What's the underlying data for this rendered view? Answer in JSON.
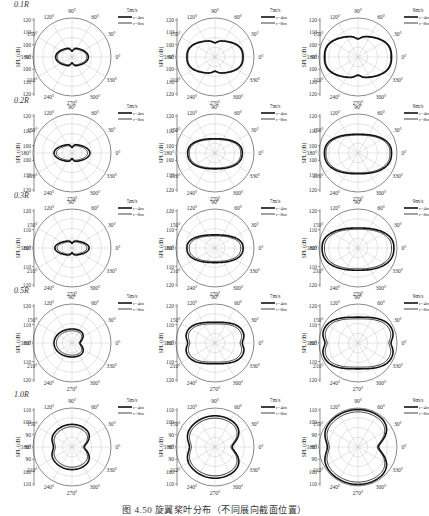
{
  "figure": {
    "caption": "图 4.50  旋翼桨叶分布（不同展向截面位置）"
  },
  "chart_data": {
    "type": "polar-grid",
    "angle_labels": [
      "0°",
      "30°",
      "60°",
      "90°",
      "120°",
      "150°",
      "180°",
      "210°",
      "240°",
      "270°",
      "300°",
      "330°"
    ],
    "ylabel": "SPL (dB)",
    "legend_entries": [
      "r=4m",
      "r=8m"
    ],
    "columns": [
      "5m/s",
      "7m/s",
      "9m/s"
    ],
    "rows": [
      {
        "label": "0.1R",
        "radial_ticks": [
          "120",
          "110",
          "100",
          "90",
          "100",
          "110",
          "120"
        ],
        "panels": [
          {
            "speed": "5m/s",
            "shape": "peanut",
            "size_r4": 0.42,
            "size_r8": 0.38,
            "aspect": 0.55
          },
          {
            "speed": "7m/s",
            "shape": "oval-flat",
            "size_r4": 0.72,
            "size_r8": 0.7,
            "aspect": 0.58
          },
          {
            "speed": "9m/s",
            "shape": "oval-flat",
            "size_r4": 0.86,
            "size_r8": 0.84,
            "aspect": 0.62
          }
        ]
      },
      {
        "label": "0.2R",
        "radial_ticks": [
          "120",
          "110",
          "100",
          "100",
          "110",
          "120"
        ],
        "panels": [
          {
            "speed": "5m/s",
            "shape": "peanut",
            "size_r4": 0.46,
            "size_r8": 0.4,
            "aspect": 0.48
          },
          {
            "speed": "7m/s",
            "shape": "lens",
            "size_r4": 0.7,
            "size_r8": 0.66,
            "aspect": 0.58
          },
          {
            "speed": "9m/s",
            "shape": "lens",
            "size_r4": 0.86,
            "size_r8": 0.82,
            "aspect": 0.62
          }
        ]
      },
      {
        "label": "0.3R",
        "radial_ticks": [
          "120",
          "110",
          "100",
          "110",
          "120"
        ],
        "panels": [
          {
            "speed": "5m/s",
            "shape": "peanut",
            "size_r4": 0.44,
            "size_r8": 0.38,
            "aspect": 0.42
          },
          {
            "speed": "7m/s",
            "shape": "lens",
            "size_r4": 0.72,
            "size_r8": 0.66,
            "aspect": 0.52
          },
          {
            "speed": "9m/s",
            "shape": "lens",
            "size_r4": 0.92,
            "size_r8": 0.86,
            "aspect": 0.62
          }
        ]
      },
      {
        "label": "0.5R",
        "radial_ticks": [
          "120",
          "110",
          "100",
          "110",
          "120"
        ],
        "panels": [
          {
            "speed": "5m/s",
            "shape": "notch",
            "size_r4": 0.46,
            "size_r8": 0.4,
            "aspect": 0.78
          },
          {
            "speed": "7m/s",
            "shape": "cup",
            "size_r4": 0.76,
            "size_r8": 0.7,
            "aspect": 0.7
          },
          {
            "speed": "9m/s",
            "shape": "cup",
            "size_r4": 0.92,
            "size_r8": 0.86,
            "aspect": 0.72
          }
        ]
      },
      {
        "label": "1.0R",
        "radial_ticks": [
          "110",
          "100",
          "90",
          "80",
          "90",
          "100",
          "110"
        ],
        "panels": [
          {
            "speed": "5m/s",
            "shape": "heart",
            "size_r4": 0.58,
            "size_r8": 0.52,
            "aspect": 1.0
          },
          {
            "speed": "7m/s",
            "shape": "heart",
            "size_r4": 0.8,
            "size_r8": 0.74,
            "aspect": 1.0
          },
          {
            "speed": "9m/s",
            "shape": "heart",
            "size_r4": 0.96,
            "size_r8": 0.9,
            "aspect": 1.0
          }
        ]
      }
    ]
  }
}
